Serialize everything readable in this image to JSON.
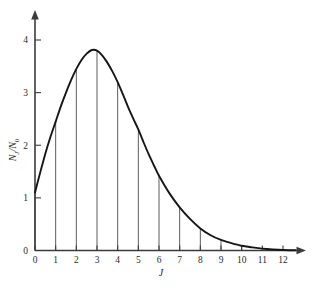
{
  "chart_data": {
    "type": "line",
    "title": "",
    "subtitle": "",
    "xlabel": "J",
    "ylabel": "N_J/N_0",
    "ylabel_parts": {
      "n1": "N",
      "sub1": "J",
      "slash": "/",
      "n2": "N",
      "sub2": "0"
    },
    "xlim": [
      0,
      12.8
    ],
    "ylim": [
      0,
      4.4
    ],
    "grid": false,
    "legend": null,
    "xticks": [
      0,
      1,
      2,
      3,
      4,
      5,
      6,
      7,
      8,
      9,
      10,
      11,
      12
    ],
    "xticklabels": [
      "0",
      "1",
      "2",
      "3",
      "4",
      "5",
      "6",
      "7",
      "8",
      "9",
      "10",
      "11",
      "12"
    ],
    "yticks": [
      0,
      1,
      2,
      3,
      4
    ],
    "yticklabels": [
      "0",
      "1",
      "2",
      "3",
      "4"
    ],
    "x": [
      0,
      1,
      2,
      3,
      4,
      5,
      6,
      7,
      8,
      9,
      10,
      11,
      12
    ],
    "values": [
      1.1,
      2.45,
      3.45,
      3.8,
      3.2,
      2.3,
      1.42,
      0.82,
      0.42,
      0.2,
      0.09,
      0.035,
      0.01
    ],
    "stems": {
      "description": "vertical drop lines from curve to x-axis at each integer J",
      "x": [
        0,
        1,
        2,
        3,
        4,
        5,
        6,
        7,
        8,
        9,
        10
      ],
      "y": [
        1.1,
        2.45,
        3.45,
        3.8,
        3.2,
        2.3,
        1.42,
        0.82,
        0.42,
        0.2,
        0.09
      ]
    },
    "peak": {
      "x": 2.8,
      "y": 3.82
    },
    "curve_samples": {
      "x": [
        0.0,
        0.25,
        0.5,
        0.75,
        1.0,
        1.25,
        1.5,
        1.75,
        2.0,
        2.25,
        2.5,
        2.75,
        3.0,
        3.25,
        3.5,
        3.75,
        4.0,
        4.25,
        4.5,
        4.75,
        5.0,
        5.25,
        5.5,
        5.75,
        6.0,
        6.5,
        7.0,
        7.5,
        8.0,
        8.5,
        9.0,
        9.5,
        10.0,
        10.5,
        11.0,
        11.5,
        12.0,
        12.6
      ],
      "y": [
        1.1,
        1.48,
        1.84,
        2.16,
        2.45,
        2.74,
        3.0,
        3.24,
        3.45,
        3.62,
        3.74,
        3.81,
        3.8,
        3.71,
        3.57,
        3.4,
        3.2,
        2.97,
        2.73,
        2.51,
        2.3,
        2.06,
        1.83,
        1.62,
        1.42,
        1.09,
        0.82,
        0.6,
        0.42,
        0.29,
        0.2,
        0.14,
        0.09,
        0.06,
        0.035,
        0.02,
        0.01,
        0.005
      ]
    },
    "colors": {
      "curve": "#161616",
      "axis": "#3b3b3b",
      "stem": "#4a4a4a",
      "text": "#2c2c2c",
      "background": "#ffffff"
    }
  },
  "figure": {
    "name": "rotational-population-distribution"
  }
}
